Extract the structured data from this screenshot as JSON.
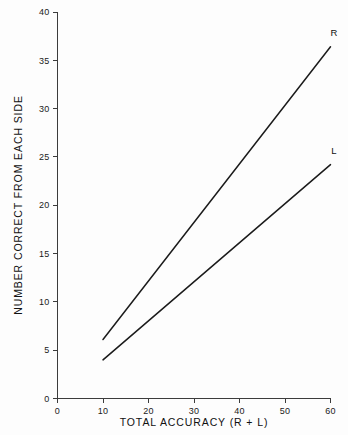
{
  "chart_data": {
    "type": "line",
    "title": "",
    "xlabel": "TOTAL ACCURACY (R + L)",
    "ylabel": "NUMBER CORRECT FROM EACH SIDE",
    "xlim": [
      0,
      60
    ],
    "ylim": [
      0,
      40
    ],
    "xticks": [
      0,
      10,
      20,
      30,
      40,
      50,
      60
    ],
    "yticks": [
      0,
      5,
      10,
      15,
      20,
      25,
      30,
      35,
      40
    ],
    "xtick_labels": [
      "0",
      "10",
      "20",
      "30",
      "40",
      "50",
      "60"
    ],
    "ytick_labels": [
      "0",
      "5",
      "10",
      "15",
      "20",
      "25",
      "30",
      "35",
      "40"
    ],
    "grid": false,
    "legend_position": "line-end-labels",
    "series": [
      {
        "name": "R",
        "label": "R",
        "color": "#1b1b1b",
        "x": [
          10,
          60
        ],
        "values": [
          6.1,
          36.4
        ]
      },
      {
        "name": "L",
        "label": "L",
        "color": "#1b1b1b",
        "x": [
          10,
          60
        ],
        "values": [
          4.0,
          24.2
        ]
      }
    ]
  },
  "figure": {
    "background": "#fdfdfd",
    "axis_color": "#3c3c3c",
    "text_color": "#111111"
  }
}
